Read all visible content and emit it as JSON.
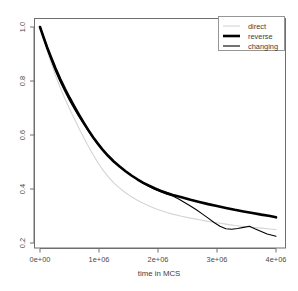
{
  "chart_data": {
    "type": "line",
    "title": "",
    "xlabel": "time in MCS",
    "ylabel": "",
    "xlim": [
      0,
      4000000
    ],
    "ylim": [
      0.17,
      1.03
    ],
    "grid": false,
    "legend_position": "top-right",
    "xticks": [
      0,
      1000000,
      2000000,
      3000000,
      4000000
    ],
    "xtick_labels": [
      "0e+00",
      "1e+06",
      "2e+06",
      "3e+06",
      "4e+06"
    ],
    "yticks": [
      0.2,
      0.4,
      0.6,
      0.8,
      1.0
    ],
    "ytick_labels": [
      "0.2",
      "0.4",
      "0.6",
      "0.8",
      "1.0"
    ],
    "series": [
      {
        "name": "direct",
        "color": "#d4d4d4",
        "width": 1.1,
        "x": [
          0,
          60000,
          120000,
          190000,
          260000,
          340000,
          420000,
          500000,
          580000,
          660000,
          740000,
          820000,
          900000,
          980000,
          1060000,
          1150000,
          1250000,
          1350000,
          1450000,
          1550000,
          1650000,
          1750000,
          1850000,
          1950000,
          2050000,
          2150000,
          2250000,
          2400000,
          2550000,
          2700000,
          2850000,
          3000000,
          3150000,
          3300000,
          3450000,
          3600000,
          3750000,
          3900000,
          4000000
        ],
        "y": [
          1.0,
          0.955,
          0.912,
          0.866,
          0.822,
          0.777,
          0.735,
          0.697,
          0.661,
          0.625,
          0.591,
          0.558,
          0.527,
          0.498,
          0.472,
          0.447,
          0.423,
          0.403,
          0.386,
          0.371,
          0.358,
          0.347,
          0.337,
          0.328,
          0.32,
          0.313,
          0.307,
          0.299,
          0.292,
          0.286,
          0.28,
          0.275,
          0.27,
          0.265,
          0.261,
          0.258,
          0.255,
          0.252,
          0.25
        ]
      },
      {
        "name": "reverse",
        "color": "#000000",
        "width": 2.6,
        "x": [
          0,
          60000,
          120000,
          190000,
          260000,
          340000,
          420000,
          500000,
          580000,
          660000,
          740000,
          820000,
          900000,
          980000,
          1060000,
          1150000,
          1250000,
          1350000,
          1450000,
          1550000,
          1650000,
          1750000,
          1850000,
          1950000,
          2050000,
          2150000,
          2250000,
          2400000,
          2550000,
          2700000,
          2850000,
          3000000,
          3150000,
          3300000,
          3450000,
          3600000,
          3750000,
          3900000,
          4000000
        ],
        "y": [
          1.0,
          0.962,
          0.925,
          0.886,
          0.848,
          0.808,
          0.772,
          0.738,
          0.706,
          0.675,
          0.646,
          0.618,
          0.592,
          0.568,
          0.546,
          0.524,
          0.502,
          0.483,
          0.466,
          0.45,
          0.436,
          0.423,
          0.412,
          0.402,
          0.393,
          0.385,
          0.378,
          0.369,
          0.36,
          0.352,
          0.344,
          0.337,
          0.33,
          0.323,
          0.317,
          0.311,
          0.305,
          0.3,
          0.295
        ]
      },
      {
        "name": "changing",
        "color": "#000000",
        "width": 1.1,
        "x": [
          0,
          60000,
          120000,
          190000,
          260000,
          340000,
          420000,
          500000,
          580000,
          660000,
          740000,
          820000,
          900000,
          980000,
          1060000,
          1150000,
          1250000,
          1350000,
          1450000,
          1550000,
          1650000,
          1750000,
          1850000,
          1950000,
          2050000,
          2150000,
          2250000,
          2350000,
          2450000,
          2550000,
          2650000,
          2750000,
          2850000,
          2950000,
          3050000,
          3150000,
          3250000,
          3350000,
          3450000,
          3550000,
          3650000,
          3750000,
          3850000,
          4000000
        ],
        "y": [
          1.0,
          0.96,
          0.92,
          0.878,
          0.838,
          0.798,
          0.762,
          0.728,
          0.697,
          0.668,
          0.641,
          0.614,
          0.589,
          0.566,
          0.545,
          0.524,
          0.503,
          0.484,
          0.466,
          0.45,
          0.435,
          0.421,
          0.409,
          0.398,
          0.389,
          0.381,
          0.374,
          0.363,
          0.35,
          0.337,
          0.323,
          0.308,
          0.292,
          0.276,
          0.262,
          0.253,
          0.251,
          0.254,
          0.258,
          0.262,
          0.252,
          0.243,
          0.233,
          0.225
        ]
      }
    ]
  },
  "legend": {
    "entries": [
      {
        "label": "direct"
      },
      {
        "label": "reverse"
      },
      {
        "label": "changing"
      }
    ]
  },
  "axes": {
    "x_title": "time in MCS"
  },
  "colors": {
    "direct": "#d4d4d4",
    "reverse": "#000000",
    "changing": "#000000",
    "frame": "#6e6e6e",
    "tick_text": "#4a4a4a"
  }
}
